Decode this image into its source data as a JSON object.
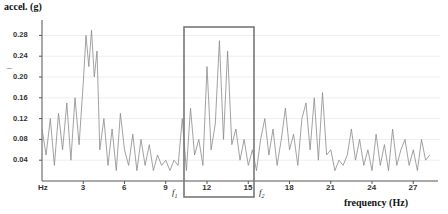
{
  "chart_data": {
    "type": "line",
    "title": "",
    "xlabel": "frequency (Hz)",
    "ylabel": "accel. (g)",
    "x_origin_label": "Hz",
    "xlim": [
      0,
      28.5
    ],
    "ylim": [
      0,
      0.3
    ],
    "x_ticks": [
      3,
      6,
      9,
      12,
      15,
      18,
      21,
      24,
      27
    ],
    "x_tick_labels": [
      "3",
      "6",
      "9",
      "12",
      "15",
      "18",
      "21",
      "24",
      "27"
    ],
    "y_ticks": [
      0.04,
      0.08,
      0.12,
      0.16,
      0.2,
      0.24,
      0.28
    ],
    "y_tick_labels": [
      "0.04",
      "0.08",
      "0.12",
      "0.16",
      "0.20",
      "0.24",
      "0.28"
    ],
    "grid": "horizontal, faint",
    "series": [
      {
        "name": "acceleration spectrum",
        "color": "#8a8a8a",
        "x": [
          0,
          0.3,
          0.6,
          0.9,
          1.2,
          1.5,
          1.8,
          2.1,
          2.4,
          2.7,
          3.0,
          3.2,
          3.4,
          3.6,
          3.8,
          4.0,
          4.2,
          4.5,
          4.8,
          5.1,
          5.4,
          5.7,
          6.0,
          6.3,
          6.6,
          6.9,
          7.2,
          7.5,
          7.8,
          8.1,
          8.4,
          8.7,
          9.0,
          9.3,
          9.6,
          9.9,
          10.2,
          10.5,
          10.8,
          11.1,
          11.4,
          11.7,
          12.0,
          12.3,
          12.6,
          12.9,
          13.2,
          13.5,
          13.8,
          14.1,
          14.4,
          14.7,
          15.0,
          15.3,
          15.6,
          15.9,
          16.2,
          16.5,
          16.8,
          17.1,
          17.4,
          17.7,
          18.0,
          18.3,
          18.6,
          18.9,
          19.2,
          19.5,
          19.8,
          20.1,
          20.4,
          20.7,
          21.0,
          21.3,
          21.6,
          21.9,
          22.2,
          22.5,
          22.8,
          23.1,
          23.4,
          23.7,
          24.0,
          24.3,
          24.6,
          24.9,
          25.2,
          25.5,
          25.8,
          26.1,
          26.4,
          26.7,
          27.0,
          27.3,
          27.6,
          27.9,
          28.2
        ],
        "values": [
          0.1,
          0.05,
          0.12,
          0.03,
          0.13,
          0.06,
          0.15,
          0.04,
          0.16,
          0.07,
          0.19,
          0.28,
          0.22,
          0.29,
          0.2,
          0.25,
          0.06,
          0.12,
          0.03,
          0.1,
          0.02,
          0.13,
          0.06,
          0.03,
          0.09,
          0.02,
          0.08,
          0.03,
          0.07,
          0.02,
          0.05,
          0.03,
          0.04,
          0.02,
          0.04,
          0.03,
          0.12,
          0.02,
          0.14,
          0.05,
          0.08,
          0.03,
          0.22,
          0.06,
          0.11,
          0.27,
          0.08,
          0.25,
          0.07,
          0.1,
          0.04,
          0.08,
          0.03,
          0.06,
          0.02,
          0.08,
          0.12,
          0.05,
          0.1,
          0.03,
          0.08,
          0.14,
          0.06,
          0.09,
          0.03,
          0.12,
          0.15,
          0.06,
          0.16,
          0.04,
          0.17,
          0.05,
          0.06,
          0.02,
          0.04,
          0.03,
          0.05,
          0.1,
          0.04,
          0.08,
          0.03,
          0.06,
          0.02,
          0.09,
          0.03,
          0.07,
          0.02,
          0.1,
          0.03,
          0.06,
          0.08,
          0.03,
          0.06,
          0.02,
          0.08,
          0.04,
          0.05
        ]
      }
    ],
    "annotations": [
      {
        "type": "rectangle",
        "label_left": "f1",
        "label_right": "f2",
        "x_range": [
          10.5,
          15.5
        ],
        "y_range": [
          -0.03,
          0.3
        ]
      },
      {
        "type": "text",
        "text": "f",
        "subscript": "1",
        "position": "below-left of rectangle"
      },
      {
        "type": "text",
        "text": "f",
        "subscript": "2",
        "position": "below-right of rectangle"
      }
    ]
  },
  "labels": {
    "ylabel": "accel. (g)",
    "xlabel": "frequency (Hz)",
    "origin": "Hz",
    "f1": "f",
    "f1_sub": "1",
    "f2": "f",
    "f2_sub": "2",
    "dash": "–"
  }
}
